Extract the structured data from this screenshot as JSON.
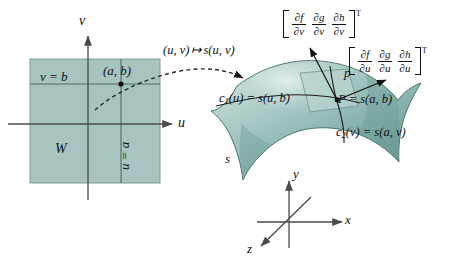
{
  "figure": {
    "colors": {
      "domain_fill": "#a8c4c0",
      "domain_stroke": "#6f8f8c",
      "surface_light": "#cfe2df",
      "surface_mid": "#9dc2bd",
      "surface_dark": "#5f8c88",
      "tangent_plane": "#b9d2cf",
      "line": "#4a4a4a",
      "text": "#111111"
    }
  },
  "domain": {
    "region_label": "W",
    "axis_v_label": "v",
    "axis_u_label": "u",
    "line_v_label": "v = b",
    "line_u_label": "u = a",
    "point_label": "(a, b)"
  },
  "mapping": {
    "label_left": "(u, v)",
    "maps_to": "↦",
    "label_right": "s(u, v)"
  },
  "surface": {
    "surface_label": "s",
    "tangent_plane_label": "p",
    "point_label_P": "P",
    "point_equals": "= s(a, b)",
    "curve1_name": "c",
    "curve1_sub": "1",
    "curve1_rest": "(u) = s(u, b)",
    "curve2_name": "c",
    "curve2_sub": "2",
    "curve2_rest": "(v) = s(a, v)"
  },
  "axes3d": {
    "x_label": "x",
    "y_label": "y",
    "z_label": "z"
  },
  "vector_v": {
    "cells": [
      {
        "num": "∂f",
        "den": "∂v"
      },
      {
        "num": "∂g",
        "den": "∂v"
      },
      {
        "num": "∂h",
        "den": "∂v"
      }
    ],
    "transpose": "T"
  },
  "vector_u": {
    "cells": [
      {
        "num": "∂f",
        "den": "∂u"
      },
      {
        "num": "∂g",
        "den": "∂u"
      },
      {
        "num": "∂h",
        "den": "∂u"
      }
    ],
    "transpose": "T"
  }
}
